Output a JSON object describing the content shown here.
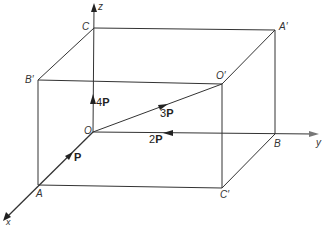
{
  "diagram": {
    "type": "3D box with force vectors",
    "colors": {
      "line": "#333333",
      "background": "#ffffff"
    },
    "axes": {
      "x": "x",
      "y": "y",
      "z": "z"
    },
    "points": {
      "O": "O",
      "A": "A",
      "B": "B",
      "C": "C",
      "A_prime": "A′",
      "B_prime": "B′",
      "C_prime": "C′",
      "O_prime": "O′"
    },
    "vectors": [
      {
        "coef": "",
        "sym": "P",
        "along": "x-axis (O→A)"
      },
      {
        "coef": "2",
        "sym": "P",
        "along": "y-axis (B→O)"
      },
      {
        "coef": "3",
        "sym": "P",
        "along": "diagonal O→O′"
      },
      {
        "coef": "4",
        "sym": "P",
        "along": "z-axis (O→C)"
      }
    ]
  }
}
